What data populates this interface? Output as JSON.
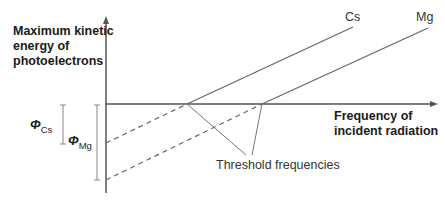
{
  "diagram": {
    "y_axis_label_lines": [
      "Maximum kinetic",
      "energy of",
      "photoelectrons"
    ],
    "x_axis_label_lines": [
      "Frequency of",
      "incident radiation"
    ],
    "lines": [
      {
        "name": "Cs",
        "label": "Cs",
        "threshold_x": 187,
        "intercept_y": 143
      },
      {
        "name": "Mg",
        "label": "Mg",
        "threshold_x": 262,
        "intercept_y": 180
      }
    ],
    "work_functions": [
      {
        "symbol": "Φ",
        "subscript": "Cs"
      },
      {
        "symbol": "Φ",
        "subscript": "Mg"
      }
    ],
    "annotation": "Threshold frequencies",
    "colors": {
      "axis": "#555555",
      "line": "#666666",
      "text": "#1a1a1a"
    }
  }
}
